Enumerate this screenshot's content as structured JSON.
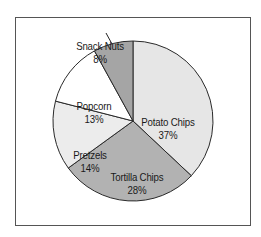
{
  "chart_data": {
    "type": "pie",
    "title": "",
    "slices": [
      {
        "name": "Potato Chips",
        "value": 37,
        "label": "37%",
        "color": "#e6e6e6"
      },
      {
        "name": "Tortilla Chips",
        "value": 28,
        "label": "28%",
        "color": "#b2b2b2"
      },
      {
        "name": "Pretzels",
        "value": 14,
        "label": "14%",
        "color": "#ececec"
      },
      {
        "name": "Popcorn",
        "value": 13,
        "label": "13%",
        "color": "#ffffff"
      },
      {
        "name": "Snack Nuts",
        "value": 8,
        "label": "8%",
        "color": "#a5a5a5"
      }
    ],
    "start_angle_deg": 0,
    "direction": "clockwise",
    "legend": "none",
    "annotations": [
      {
        "target": "Snack Nuts",
        "type": "leader-line"
      }
    ]
  }
}
